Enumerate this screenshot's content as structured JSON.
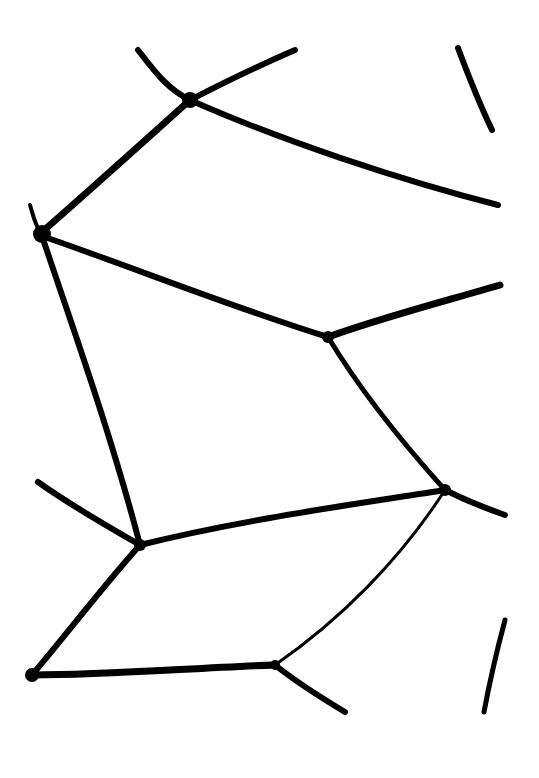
{
  "image": {
    "description": "Black ink line drawing of an irregular cellular/polygonal network on a white background",
    "background": "#ffffff",
    "ink": "#000000",
    "width": 539,
    "height": 778
  },
  "strokes": [
    {
      "id": "top-left-upper",
      "d": "M138 50 C150 65 165 88 190 100",
      "w": 6
    },
    {
      "id": "top-to-upper-right",
      "d": "M190 100 C225 82 260 65 295 50",
      "w": 6
    },
    {
      "id": "top-right-sliver",
      "d": "M458 48 C470 80 480 105 492 130",
      "w": 6
    },
    {
      "id": "upper-long-right",
      "d": "M190 100 C280 140 400 180 498 205",
      "w": 6
    },
    {
      "id": "upper-left-diagonal",
      "d": "M190 100 C140 145 90 190 42 232",
      "w": 7
    },
    {
      "id": "left-notch",
      "d": "M30 205 C33 215 35 225 42 236",
      "w": 4
    },
    {
      "id": "mid-horizontal",
      "d": "M42 236 C140 270 240 310 328 337",
      "w": 6
    },
    {
      "id": "mid-right-upper",
      "d": "M328 337 C390 315 450 300 500 285",
      "w": 7
    },
    {
      "id": "left-vertical",
      "d": "M42 236 C70 320 110 430 140 545",
      "w": 6
    },
    {
      "id": "right-diagonal",
      "d": "M328 337 C360 390 400 440 445 490",
      "w": 5
    },
    {
      "id": "lower-right-stub",
      "d": "M445 490 C465 500 485 508 505 515",
      "w": 6
    },
    {
      "id": "lower-left-stub",
      "d": "M38 482 C70 505 105 525 140 545",
      "w": 6
    },
    {
      "id": "lower-mid-line",
      "d": "M140 545 C240 520 350 505 445 490",
      "w": 6
    },
    {
      "id": "lower-left-diagonal",
      "d": "M140 545 C100 590 70 630 32 675",
      "w": 6
    },
    {
      "id": "lower-faint-diagonal",
      "d": "M445 490 C400 560 340 620 275 665",
      "w": 3
    },
    {
      "id": "bottom-horizontal",
      "d": "M32 675 C110 675 190 668 275 665",
      "w": 7
    },
    {
      "id": "bottom-right-stub",
      "d": "M275 665 C300 685 325 700 345 712",
      "w": 6
    },
    {
      "id": "bottom-right-sliver",
      "d": "M505 620 C497 650 490 680 484 712",
      "w": 5
    }
  ]
}
